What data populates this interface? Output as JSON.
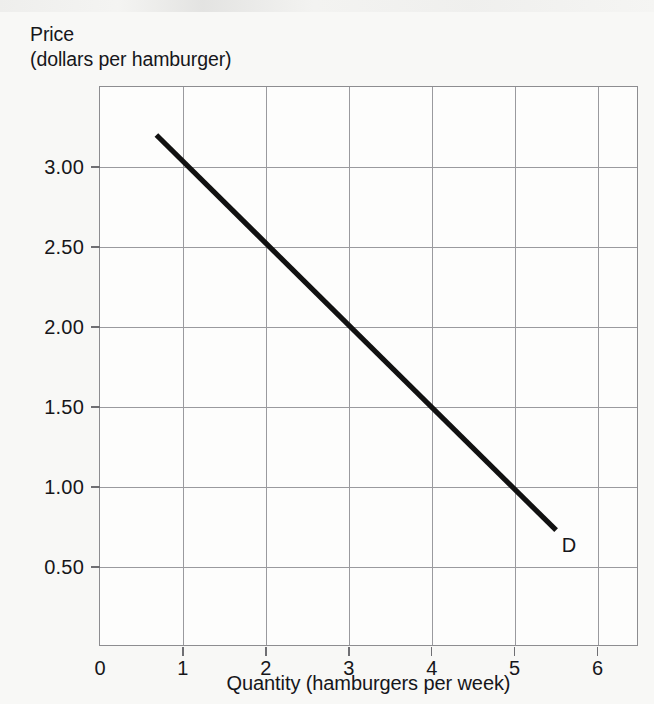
{
  "figure": {
    "y_axis_title_line1": "Price",
    "y_axis_title_line2": "(dollars per hamburger)",
    "x_axis_title": "Quantity (hamburgers per week)",
    "curve_label": "D",
    "line_color": "#111111",
    "grid_color": "#9a9a9e",
    "frame_color": "#8d8d90",
    "background_color": "#f8f8f6",
    "plot_background_color": "#fdfdfc"
  },
  "chart_data": {
    "type": "line",
    "title": "",
    "subtitle": "",
    "xlabel": "Quantity (hamburgers per week)",
    "ylabel": "Price (dollars per hamburger)",
    "xlim": [
      0,
      6.5
    ],
    "ylim": [
      0,
      3.5
    ],
    "grid": true,
    "legend": "inline-curve-label",
    "xticks": [
      0,
      1,
      2,
      3,
      4,
      5,
      6
    ],
    "xtick_labels": [
      "0",
      "1",
      "2",
      "3",
      "4",
      "5",
      "6"
    ],
    "yticks": [
      3.0,
      2.5,
      2.0,
      1.5,
      1.0,
      0.5
    ],
    "ytick_labels": [
      "3.00",
      "2.50",
      "2.00",
      "1.50",
      "1.00",
      "0.50"
    ],
    "series": [
      {
        "name": "D",
        "label": "D",
        "annotation": "D",
        "description": "Downward-sloping linear demand curve for hamburgers",
        "slope_dollars_per_unit": -0.5,
        "intercept_dollars": 3.5,
        "x": [
          0.68,
          1.0,
          2.0,
          3.0,
          4.0,
          5.0,
          5.5
        ],
        "y": [
          3.2,
          3.0,
          2.5,
          2.0,
          1.5,
          1.0,
          0.73
        ],
        "endpoints": {
          "start": [
            0.68,
            3.2
          ],
          "end": [
            5.5,
            0.73
          ]
        },
        "labelled_points": [
          {
            "quantity": 2,
            "price": 2.5
          },
          {
            "quantity": 3,
            "price": 2.0
          },
          {
            "quantity": 4,
            "price": 1.5
          },
          {
            "quantity": 5,
            "price": 1.0
          }
        ]
      }
    ]
  }
}
